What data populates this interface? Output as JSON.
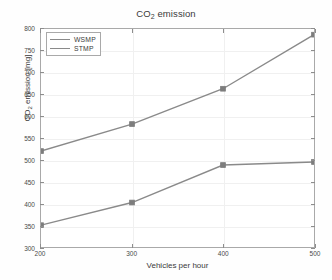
{
  "chart_data": {
    "type": "line",
    "title": "CO2 emission",
    "title_parts": {
      "main": "CO",
      "sub": "2",
      "tail": " emission"
    },
    "xlabel": "Vehicles per hour",
    "ylabel": "CO2 emission [mg]",
    "ylabel_parts": {
      "main": "CO",
      "sub": "2",
      "tail": " emission [mg]"
    },
    "x": [
      200,
      300,
      400,
      500
    ],
    "xticks": [
      "200",
      "300",
      "400",
      "500"
    ],
    "yticks": [
      "300",
      "350",
      "400",
      "450",
      "500",
      "550",
      "600",
      "650",
      "700",
      "750",
      "800"
    ],
    "xlim": [
      200,
      500
    ],
    "ylim": [
      300,
      800
    ],
    "grid": true,
    "legend_position": "upper left",
    "series": [
      {
        "name": "WSMP",
        "values": [
          520,
          582,
          663,
          787
        ],
        "color": "#8a8a8a"
      },
      {
        "name": "STMP",
        "values": [
          350,
          402,
          488,
          495
        ],
        "color": "#8a8a8a"
      }
    ]
  },
  "legend": {
    "items": [
      {
        "label": "WSMP"
      },
      {
        "label": "STMP"
      }
    ]
  },
  "colors": {
    "line": "#8a8a8a",
    "marker": "#7d7d7d",
    "axis": "#a9a9a9",
    "grid": "#f0f0f0",
    "text": "#3a3a3a",
    "background": "#ffffff"
  }
}
